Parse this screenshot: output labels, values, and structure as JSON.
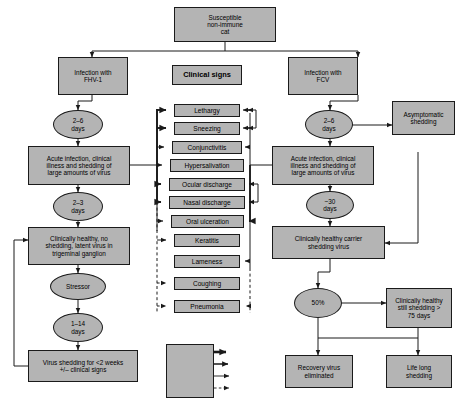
{
  "diagram": {
    "title_nodes": {
      "root": "Susceptible\nnon-immune\ncat",
      "clinical_signs_header": "Clinical signs"
    },
    "left_branch": {
      "infection": "Infection with\nFHV-1",
      "incubation": "2–6\ndays",
      "acute": "Acute infection, clinical\nillness and shedding of\nlarge amounts of virus",
      "duration": "2–3\ndays",
      "latent": "Clinically healthy, no\nshedding, latent virus in\ntrigeminal ganglion",
      "trigger": "Stressor",
      "recrudescence_delay": "1–14\ndays",
      "shedding": "Virus shedding for <2 weeks\n+/– clinical signs"
    },
    "right_branch": {
      "infection": "Infection with\nFCV",
      "incubation": "2–6\ndays",
      "asymptomatic": "Asymptomatic\nshedding",
      "acute": "Acute infection, clinical\nillness and shedding of\nlarge amounts of virus",
      "duration": "~30\ndays",
      "carrier": "Clinically healthy carrier\nshedding virus",
      "split": "50%",
      "persistent": "Clinically healthy\nstill shedding >\n75 days",
      "recovery": "Recovery virus\neliminated",
      "lifelong": "Life long\nshedding"
    },
    "clinical_signs": [
      "Lethargy",
      "Sneezing",
      "Conjunctivitis",
      "Hypersalivation",
      "Ocular discharge",
      "Nasal discharge",
      "Oral ulceration",
      "Keratitis",
      "Lameness",
      "Coughing",
      "Pneumonia"
    ],
    "legend": {
      "rows": [
        {
          "label": "Marked",
          "style": "marked"
        },
        {
          "label": "Moderate",
          "style": "moderate"
        },
        {
          "label": "Mild",
          "style": "mild"
        },
        {
          "label": "Uncommon",
          "style": "uncommon"
        }
      ]
    },
    "colors": {
      "node_fill": "#b4b4b4",
      "node_stroke": "#1a1a1a",
      "line": "#1a1a1a",
      "background": "#ffffff"
    }
  }
}
